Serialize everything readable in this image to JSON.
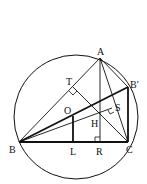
{
  "diagram": {
    "type": "geometry",
    "colors": {
      "stroke": "#111111",
      "background": "#ffffff"
    },
    "circle": {
      "cx": 76,
      "cy": 117,
      "r": 62
    },
    "points": {
      "A": {
        "label": "A",
        "x": 100,
        "y": 58
      },
      "B": {
        "label": "B",
        "x": 19,
        "y": 142
      },
      "C": {
        "label": "C",
        "x": 128,
        "y": 142
      },
      "Bp": {
        "label": "B′",
        "x": 128,
        "y": 87
      },
      "O": {
        "label": "O",
        "x": 73,
        "y": 116
      },
      "H": {
        "label": "H",
        "x": 100,
        "y": 118
      },
      "L": {
        "label": "L",
        "x": 73,
        "y": 142
      },
      "R": {
        "label": "R",
        "x": 100,
        "y": 142
      },
      "T": {
        "label": "T",
        "x": 73,
        "y": 87
      },
      "S": {
        "label": "S",
        "x": 112,
        "y": 108
      }
    },
    "labels": [
      "A",
      "B",
      "C",
      "B′",
      "O",
      "H",
      "L",
      "R",
      "T",
      "S"
    ]
  }
}
